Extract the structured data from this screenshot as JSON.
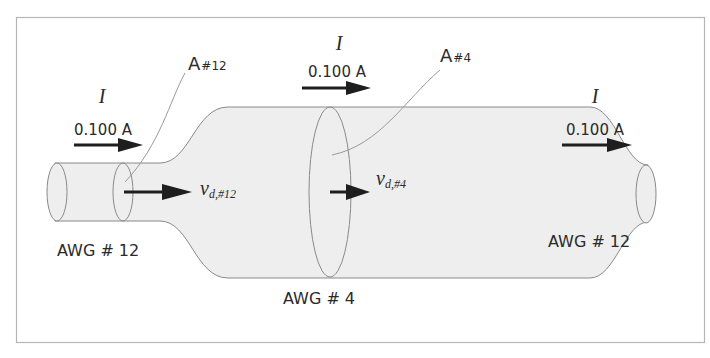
{
  "diagram": {
    "current_symbol": "I",
    "current_value": "0.100 A",
    "left_wire": {
      "gauge_label": "AWG # 12",
      "area_label_main": "A",
      "area_label_sub": "#12",
      "velocity_label_main": "v",
      "velocity_label_sub": "d,#12"
    },
    "middle_wire": {
      "gauge_label": "AWG # 4",
      "area_label_main": "A",
      "area_label_sub": "#4",
      "velocity_label_main": "v",
      "velocity_label_sub": "d,#4"
    },
    "right_wire": {
      "gauge_label": "AWG # 12"
    },
    "current_labels": [
      {
        "symbol": "I",
        "value": "0.100 A",
        "position": "left"
      },
      {
        "symbol": "I",
        "value": "0.100 A",
        "position": "middle"
      },
      {
        "symbol": "I",
        "value": "0.100 A",
        "position": "right"
      }
    ],
    "colors": {
      "wire_fill": "#eeeeee",
      "outline": "#8a8a8a",
      "arrow": "#1e1e1e",
      "frame": "#b5b5b5",
      "text": "#2a2a2a"
    }
  }
}
